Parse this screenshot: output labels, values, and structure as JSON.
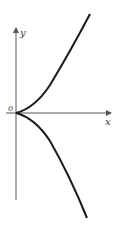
{
  "diagram": {
    "title": "",
    "curve": "semicubical parabola (cusp at origin)",
    "labels": {
      "y_axis": "y",
      "x_axis": "x",
      "origin": "0"
    },
    "colors": {
      "axis": "#555555",
      "curve": "#1a1a1a",
      "background": "#ffffff"
    }
  }
}
